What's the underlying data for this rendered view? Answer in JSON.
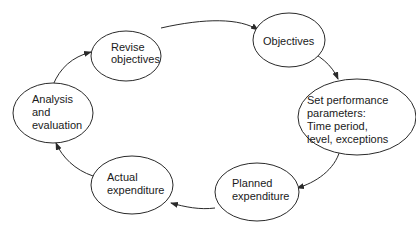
{
  "diagram": {
    "type": "cycle",
    "colors": {
      "stroke": "#2a2a2a",
      "text": "#1a1a1a",
      "fill": "#ffffff"
    },
    "nodes": [
      {
        "id": "revise",
        "lines": [
          "Revise",
          "objectives"
        ]
      },
      {
        "id": "objectives",
        "lines": [
          "Objectives"
        ]
      },
      {
        "id": "set",
        "lines": [
          "Set performance",
          "parameters:",
          "Time period,",
          "level, exceptions"
        ]
      },
      {
        "id": "planned",
        "lines": [
          "Planned",
          "expenditure"
        ]
      },
      {
        "id": "actual",
        "lines": [
          "Actual",
          "expenditure"
        ]
      },
      {
        "id": "analysis",
        "lines": [
          "Analysis",
          "and",
          "evaluation"
        ]
      }
    ],
    "edges": [
      {
        "from": "revise",
        "to": "objectives"
      },
      {
        "from": "objectives",
        "to": "set"
      },
      {
        "from": "set",
        "to": "planned"
      },
      {
        "from": "planned",
        "to": "actual"
      },
      {
        "from": "actual",
        "to": "analysis"
      },
      {
        "from": "analysis",
        "to": "revise"
      }
    ]
  }
}
